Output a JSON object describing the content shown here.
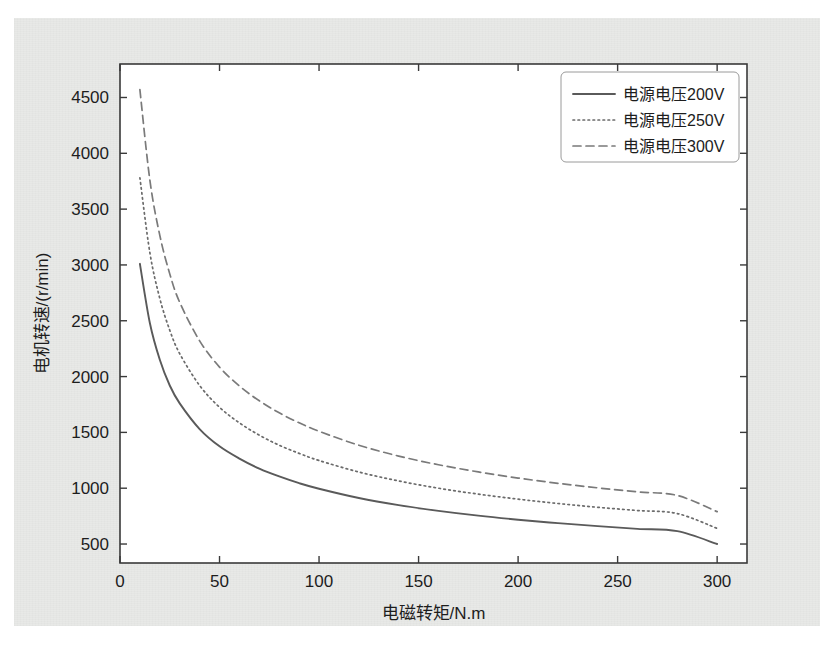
{
  "chart_data": {
    "type": "line",
    "title": "",
    "xlabel": "电磁转矩/N.m",
    "ylabel": "电机转速/(r/min)",
    "xlim": [
      0,
      315
    ],
    "ylim": [
      330,
      4800
    ],
    "xticks": [
      0,
      50,
      100,
      150,
      200,
      250,
      300
    ],
    "xticklabels": [
      "0",
      "50",
      "100",
      "150",
      "200",
      "250",
      "300"
    ],
    "yticks": [
      500,
      1000,
      1500,
      2000,
      2500,
      3000,
      3500,
      4000,
      4500
    ],
    "yticklabels": [
      "500",
      "1000",
      "1500",
      "2000",
      "2500",
      "3000",
      "3500",
      "4000",
      "4500"
    ],
    "grid": false,
    "legend_position": "upper right",
    "x": [
      10,
      15,
      20,
      25,
      30,
      40,
      50,
      60,
      70,
      80,
      90,
      100,
      120,
      140,
      160,
      180,
      200,
      220,
      240,
      260,
      280,
      300
    ],
    "series": [
      {
        "name": "电源电压200V",
        "linestyle": "solid",
        "color": "#5a5a5a",
        "values": [
          3010,
          2480,
          2150,
          1920,
          1760,
          1530,
          1375,
          1265,
          1175,
          1105,
          1045,
          995,
          912,
          848,
          797,
          754,
          718,
          687,
          660,
          636,
          615,
          500
        ]
      },
      {
        "name": "电源电压250V",
        "linestyle": "dotted",
        "color": "#6b6b6b",
        "values": [
          3780,
          3110,
          2700,
          2415,
          2205,
          1920,
          1725,
          1585,
          1475,
          1385,
          1312,
          1248,
          1145,
          1065,
          1000,
          947,
          902,
          863,
          829,
          800,
          773,
          640
        ]
      },
      {
        "name": "电源电压300V",
        "linestyle": "dashed",
        "color": "#7a7a7a",
        "values": [
          4570,
          3760,
          3265,
          2920,
          2665,
          2320,
          2085,
          1915,
          1783,
          1675,
          1586,
          1510,
          1385,
          1288,
          1210,
          1146,
          1091,
          1044,
          1003,
          967,
          935,
          790
        ]
      }
    ]
  },
  "axes": {
    "spine_color": "#3a3a3a",
    "background": "#ffffff"
  },
  "figure": {
    "background": "#e8e9e7"
  }
}
